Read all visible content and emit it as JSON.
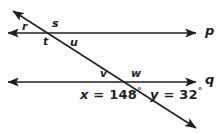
{
  "figure": {
    "kind": "geometry-diagram",
    "stroke_color": "#231f20",
    "background_color": "#fdfdfd",
    "width": 224,
    "height": 134
  },
  "lines": [
    {
      "name": "p",
      "label": "p",
      "orientation": "horizontal",
      "double_arrow": true,
      "x1": 8,
      "y1": 33,
      "x2": 196,
      "y2": 33,
      "label_x": 207,
      "label_y": 27
    },
    {
      "name": "q",
      "label": "q",
      "orientation": "horizontal",
      "double_arrow": true,
      "x1": 8,
      "y1": 82,
      "x2": 196,
      "y2": 82,
      "label_x": 207,
      "label_y": 76
    },
    {
      "name": "transversal",
      "label": "",
      "orientation": "diagonal",
      "double_arrow": true,
      "x1": 13,
      "y1": 11,
      "x2": 196,
      "y2": 128,
      "label_x": 0,
      "label_y": 0
    }
  ],
  "angle_labels": [
    {
      "id": "r",
      "text": "r",
      "x": 22,
      "y": 21
    },
    {
      "id": "s",
      "text": "s",
      "x": 52,
      "y": 19
    },
    {
      "id": "t",
      "text": "t",
      "x": 43,
      "y": 36
    },
    {
      "id": "u",
      "text": "u",
      "x": 70,
      "y": 37
    },
    {
      "id": "v",
      "text": "v",
      "x": 100,
      "y": 69
    },
    {
      "id": "w",
      "text": "w",
      "x": 131,
      "y": 69
    }
  ],
  "equations": [
    {
      "id": "x-angle",
      "variable": "x",
      "equals": "=",
      "value": "148",
      "degree_symbol": "°",
      "full_text": "x = 148°",
      "x": 80,
      "y": 88
    },
    {
      "id": "y-angle",
      "variable": "y",
      "equals": "=",
      "value": "32",
      "degree_symbol": "°",
      "full_text": "y = 32°",
      "x": 150,
      "y": 88
    }
  ]
}
